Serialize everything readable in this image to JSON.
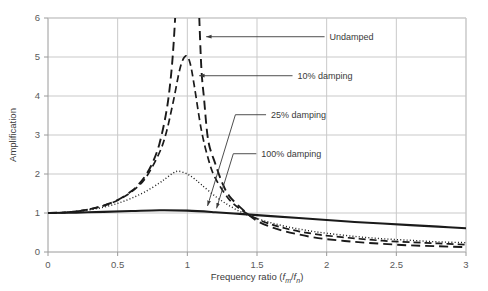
{
  "chart_data": {
    "type": "line",
    "title": "",
    "xlabel": "Frequency ratio (fm/fn)",
    "xlabel_parts": {
      "prefix": "Frequency ratio (",
      "f1": "f",
      "sub1": "m",
      "slash": "/",
      "f2": "f",
      "sub2": "n",
      "suffix": ")"
    },
    "ylabel": "Amplification",
    "xlim": [
      0,
      3
    ],
    "ylim": [
      0,
      6
    ],
    "xticks": [
      0,
      0.5,
      1,
      1.5,
      2,
      2.5,
      3
    ],
    "xticklabels": [
      "0",
      "0.5",
      "1",
      "1.5",
      "2",
      "2.5",
      "3"
    ],
    "yticks": [
      0,
      1,
      2,
      3,
      4,
      5,
      6
    ],
    "yticklabels": [
      "0",
      "1",
      "2",
      "3",
      "4",
      "5",
      "6"
    ],
    "grid": true,
    "legend": "annotations",
    "series": [
      {
        "name": "Undamped",
        "style": "long-dash",
        "color": "#1a1a1a",
        "width": 1.9,
        "damping_ratio": 0.0,
        "x": [
          0,
          0.1,
          0.2,
          0.3,
          0.4,
          0.5,
          0.6,
          0.65,
          0.7,
          0.75,
          0.8,
          0.85,
          0.88,
          0.9,
          0.92,
          0.94,
          0.95,
          1.06,
          1.08,
          1.1,
          1.12,
          1.15,
          1.2,
          1.25,
          1.3,
          1.4,
          1.5,
          1.6,
          1.7,
          1.8,
          1.9,
          2.0,
          2.2,
          2.4,
          2.6,
          2.8,
          3.0
        ],
        "y": [
          1.0,
          1.01,
          1.042,
          1.099,
          1.19,
          1.333,
          1.563,
          1.732,
          1.961,
          2.286,
          2.778,
          3.604,
          4.423,
          5.263,
          6.51,
          8.58,
          10.26,
          8.31,
          6.53,
          4.76,
          3.93,
          2.86,
          2.27,
          1.78,
          1.44,
          1.08,
          0.8,
          0.64,
          0.53,
          0.45,
          0.38,
          0.33,
          0.26,
          0.21,
          0.17,
          0.147,
          0.125
        ]
      },
      {
        "name": "10% damping",
        "style": "dash",
        "color": "#1a1a1a",
        "width": 1.7,
        "damping_ratio": 0.1,
        "peak": {
          "x": 0.99,
          "y": 5.05
        },
        "x": [
          0,
          0.1,
          0.2,
          0.3,
          0.4,
          0.5,
          0.6,
          0.7,
          0.8,
          0.85,
          0.9,
          0.95,
          0.99,
          1.02,
          1.05,
          1.1,
          1.15,
          1.2,
          1.3,
          1.4,
          1.5,
          1.6,
          1.7,
          1.8,
          1.9,
          2.0,
          2.2,
          2.4,
          2.6,
          2.8,
          3.0
        ],
        "y": [
          1.0,
          1.01,
          1.042,
          1.098,
          1.188,
          1.328,
          1.545,
          1.898,
          2.551,
          3.078,
          3.873,
          4.743,
          5.03,
          4.84,
          4.26,
          3.14,
          2.39,
          1.9,
          1.35,
          1.05,
          0.85,
          0.71,
          0.61,
          0.53,
          0.47,
          0.42,
          0.35,
          0.29,
          0.25,
          0.22,
          0.19
        ]
      },
      {
        "name": "25% damping",
        "style": "dot",
        "color": "#1a1a1a",
        "width": 1.4,
        "damping_ratio": 0.25,
        "peak": {
          "x": 0.94,
          "y": 2.3
        },
        "x": [
          0,
          0.1,
          0.2,
          0.3,
          0.4,
          0.5,
          0.6,
          0.7,
          0.8,
          0.85,
          0.9,
          0.94,
          1.0,
          1.05,
          1.1,
          1.2,
          1.3,
          1.4,
          1.5,
          1.6,
          1.7,
          1.8,
          1.9,
          2.0,
          2.2,
          2.4,
          2.6,
          2.8,
          3.0
        ],
        "y": [
          1.0,
          1.008,
          1.035,
          1.081,
          1.15,
          1.248,
          1.38,
          1.55,
          1.77,
          1.9,
          2.03,
          2.07,
          2.0,
          1.88,
          1.73,
          1.43,
          1.19,
          1.0,
          0.86,
          0.75,
          0.66,
          0.59,
          0.53,
          0.48,
          0.4,
          0.34,
          0.3,
          0.26,
          0.24
        ]
      },
      {
        "name": "100% damping",
        "style": "solid",
        "color": "#1a1a1a",
        "width": 2.1,
        "damping_ratio": 1.0,
        "x": [
          0,
          0.2,
          0.4,
          0.6,
          0.8,
          1.0,
          1.2,
          1.4,
          1.6,
          1.8,
          2.0,
          2.2,
          2.4,
          2.6,
          2.8,
          3.0
        ],
        "y": [
          1.0,
          1.01,
          1.03,
          1.05,
          1.07,
          1.06,
          1.02,
          0.97,
          0.92,
          0.87,
          0.82,
          0.77,
          0.73,
          0.69,
          0.65,
          0.61
        ]
      }
    ],
    "annotations": [
      {
        "label": "Undamped",
        "text_x": 2.02,
        "text_y": 5.52,
        "leader": [
          [
            1.985,
            5.52
          ],
          [
            1.135,
            5.52
          ]
        ],
        "arrow_at": [
          1.135,
          5.52
        ]
      },
      {
        "label": "10% damping",
        "text_x": 1.79,
        "text_y": 4.52,
        "leader": [
          [
            1.755,
            4.52
          ],
          [
            1.085,
            4.52
          ]
        ],
        "arrow_at": [
          1.085,
          4.52
        ]
      },
      {
        "label": "25% damping",
        "text_x": 1.6,
        "text_y": 3.52,
        "leader": [
          [
            1.565,
            3.52
          ],
          [
            1.345,
            3.52
          ],
          [
            1.145,
            1.18
          ]
        ],
        "arrow_at": [
          1.145,
          1.18
        ]
      },
      {
        "label": "100% damping",
        "text_x": 1.53,
        "text_y": 2.52,
        "leader": [
          [
            1.495,
            2.52
          ],
          [
            1.33,
            2.52
          ],
          [
            1.21,
            1.12
          ]
        ],
        "arrow_at": [
          1.21,
          1.12
        ]
      }
    ]
  },
  "figure": {
    "background": "#ffffff",
    "grid_color": "#c9c9c9",
    "axis_color": "#9a9a9a",
    "text_color": "#3a3a3a",
    "tick_color": "#5a5a5a",
    "line_color": "#1a1a1a"
  }
}
